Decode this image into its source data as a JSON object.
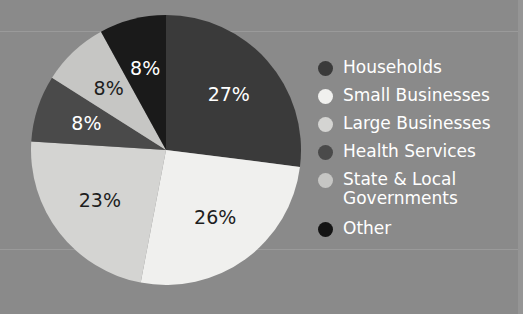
{
  "background": {
    "color": "#8a8a8a",
    "rule_color": "#9a9a9a"
  },
  "chart_data": {
    "type": "pie",
    "title": "",
    "categories": [
      "Households",
      "Small Businesses",
      "Large Businesses",
      "Health Services",
      "State & Local Governments",
      "Other"
    ],
    "values": [
      27,
      26,
      23,
      8,
      8,
      8
    ],
    "value_labels": [
      "27%",
      "26%",
      "23%",
      "8%",
      "8%",
      "8%"
    ],
    "colors": [
      "#3a3a3a",
      "#f0f0ee",
      "#d4d4d2",
      "#4a4a4a",
      "#c6c6c4",
      "#1a1a1a"
    ],
    "label_text_colors": [
      "#ffffff",
      "#1e1e1e",
      "#1e1e1e",
      "#ffffff",
      "#1e1e1e",
      "#ffffff"
    ],
    "units": "percent",
    "start_angle_deg": 0,
    "direction": "clockwise",
    "legend_position": "right",
    "grid": false
  },
  "legend": {
    "items": [
      {
        "label": "Households",
        "swatch": "#3a3a3a"
      },
      {
        "label": "Small Businesses",
        "swatch": "#f0f0ee"
      },
      {
        "label": "Large Businesses",
        "swatch": "#d4d4d2"
      },
      {
        "label": "Health Services",
        "swatch": "#4a4a4a"
      },
      {
        "label": "State & Local\nGovernments",
        "swatch": "#c6c6c4"
      },
      {
        "label": "Other",
        "swatch": "#141414"
      }
    ]
  },
  "pie_geometry": {
    "cx": 136,
    "cy": 136,
    "r": 135
  }
}
